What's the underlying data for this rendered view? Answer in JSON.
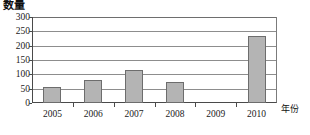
{
  "chart_data": {
    "type": "bar",
    "title": "",
    "subtitle": "",
    "xlabel": "年份",
    "ylabel": "数量",
    "categories": [
      "2005",
      "2006",
      "2007",
      "2008",
      "2009",
      "2010"
    ],
    "values": [
      57,
      80,
      115,
      75,
      0,
      235
    ],
    "series": [
      {
        "name": "数量",
        "values": [
          57,
          80,
          115,
          75,
          0,
          235
        ]
      }
    ],
    "ylim": [
      0,
      300
    ],
    "yticks": [
      "0",
      "50",
      "100",
      "150",
      "200",
      "250",
      "300"
    ],
    "ytick_values": [
      0,
      50,
      100,
      150,
      200,
      250,
      300
    ],
    "grid": "horizontal",
    "legend": "none",
    "bar_color": "#b4b4b4",
    "bar_border_color": "#6d6d6d",
    "axis_color": "#4a4a4a",
    "gridline_color": "#8d8d8d",
    "background": "#ffffff",
    "annotations": []
  }
}
